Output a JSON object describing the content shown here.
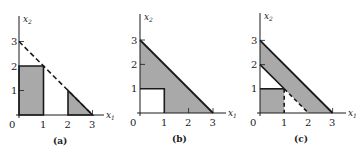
{
  "colors": {
    "shade": "#a9a9a9",
    "line": "#1a1a1a",
    "background": "#ffffff"
  },
  "axis_labels": {
    "x": "x",
    "x_sub": "1",
    "y": "x",
    "y_sub": "2"
  },
  "ticks": {
    "x": [
      "0",
      "1",
      "2",
      "3"
    ],
    "y": [
      "1",
      "2",
      "3"
    ]
  },
  "panels": [
    {
      "caption": "(a)",
      "description": "Shaded rectangle 0≤x1≤1, 0≤x2≤2 and shaded triangle (2,0)-(2,1)-(3,0); dashed line x1+x2=3",
      "shaded_regions": [
        [
          [
            0,
            0
          ],
          [
            1,
            0
          ],
          [
            1,
            2
          ],
          [
            0,
            2
          ]
        ],
        [
          [
            2,
            0
          ],
          [
            3,
            0
          ],
          [
            2,
            1
          ]
        ]
      ],
      "dashed_lines": [
        [
          [
            0,
            3
          ],
          [
            3,
            0
          ]
        ]
      ]
    },
    {
      "caption": "(b)",
      "description": "Shaded triangle under x1+x2=3 excluding unit square at origin",
      "shaded_regions": [
        [
          [
            0,
            1
          ],
          [
            0,
            3
          ],
          [
            3,
            0
          ],
          [
            1,
            0
          ],
          [
            1,
            1
          ]
        ]
      ],
      "solid_lines": [
        [
          [
            0,
            3
          ],
          [
            3,
            0
          ]
        ]
      ]
    },
    {
      "caption": "(c)",
      "description": "Shaded band between x1+x2=2 and x1+x2=3, plus shaded unit square; dashed line x1=1 and dashed segment x1+x2=2",
      "shaded_regions": [
        [
          [
            0,
            2
          ],
          [
            0,
            3
          ],
          [
            3,
            0
          ],
          [
            2,
            0
          ]
        ],
        [
          [
            0,
            0
          ],
          [
            1,
            0
          ],
          [
            1,
            1
          ],
          [
            0,
            1
          ]
        ]
      ],
      "solid_lines": [
        [
          [
            0,
            3
          ],
          [
            3,
            0
          ]
        ]
      ],
      "dashed_lines": [
        [
          [
            1,
            0
          ],
          [
            1,
            1
          ]
        ],
        [
          [
            1,
            1
          ],
          [
            2,
            0
          ]
        ]
      ]
    }
  ]
}
